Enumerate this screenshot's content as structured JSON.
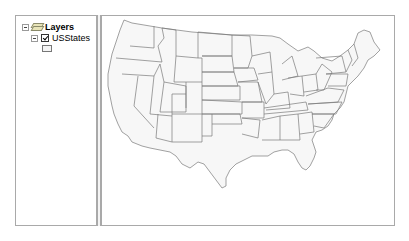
{
  "toc": {
    "root_label": "Layers",
    "layers": [
      {
        "name": "USStates",
        "checked": true,
        "symbol_fill": "#f5f5f5",
        "symbol_outline": "#777777"
      }
    ]
  },
  "map": {
    "content": "Contiguous United States state boundaries",
    "fill_color": "#f7f7f7",
    "outline_color": "#7a7a7a"
  }
}
